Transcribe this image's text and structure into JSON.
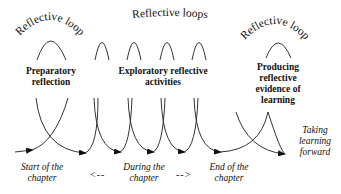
{
  "diagram": {
    "arc_labels": {
      "left": "Reflective loop",
      "middle": "Reflective loops",
      "right": "Reflective loop"
    },
    "stages": [
      {
        "line1": "Preparatory",
        "line2": "reflection"
      },
      {
        "line1": "Exploratory reflective",
        "line2": "activities"
      },
      {
        "line1": "Producing",
        "line2": "reflective",
        "line3": "evidence of",
        "line4": "learning"
      }
    ],
    "timeline": {
      "start": {
        "line1": "Start of the",
        "line2": "chapter"
      },
      "during": {
        "line1": "During the",
        "line2": "chapter"
      },
      "end": {
        "line1": "End of the",
        "line2": "chapter"
      },
      "back_arrow": "<--",
      "forward_arrow": "-->"
    },
    "outcome": {
      "line1": "Taking",
      "line2": "learning",
      "line3": "forward"
    },
    "colors": {
      "stroke": "#333333",
      "text": "#111111",
      "background": "#ffffff"
    }
  }
}
